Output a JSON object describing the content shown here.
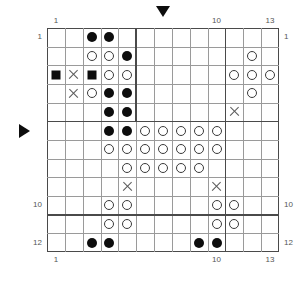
{
  "puzzle": {
    "title": "Grid Puzzle",
    "columns": 13,
    "rows": 12,
    "colors": {
      "filled": "#0d0d0d",
      "open_stroke": "#3a3a3a",
      "x_mark": "#5a5a5a",
      "grid_line": "#9a9a9a",
      "grid_line_thick": "#4a4a4a",
      "label": "#555555",
      "background": "#ffffff"
    },
    "axis_labels": {
      "top": [
        {
          "col": 1,
          "text": "1"
        },
        {
          "col": 10,
          "text": "10"
        },
        {
          "col": 13,
          "text": "13"
        }
      ],
      "bottom": [
        {
          "col": 1,
          "text": "1"
        },
        {
          "col": 10,
          "text": "10"
        },
        {
          "col": 13,
          "text": "13"
        }
      ],
      "left": [
        {
          "row": 1,
          "text": "1"
        },
        {
          "row": 10,
          "text": "10"
        },
        {
          "row": 12,
          "text": "12"
        }
      ],
      "right": [
        {
          "row": 1,
          "text": "1"
        },
        {
          "row": 10,
          "text": "10"
        },
        {
          "row": 12,
          "text": "12"
        }
      ]
    },
    "markers": [
      {
        "name": "column-marker-down",
        "glyph": "triangle-down",
        "col": 7
      },
      {
        "name": "row-marker-right",
        "glyph": "triangle-right",
        "row": 6
      }
    ],
    "thick_lines": {
      "vertical": [
        {
          "after_col": 5,
          "from_row": 1,
          "to_row": 5
        },
        {
          "after_col": 10,
          "from_row": 1,
          "to_row": 12
        }
      ],
      "horizontal": [
        {
          "after_row": 5,
          "from_col": 1,
          "to_col": 13
        },
        {
          "after_row": 10,
          "from_col": 1,
          "to_col": 13
        }
      ]
    },
    "cells": [
      {
        "row": 1,
        "col": 3,
        "mark": "filled"
      },
      {
        "row": 1,
        "col": 4,
        "mark": "filled"
      },
      {
        "row": 2,
        "col": 3,
        "mark": "open"
      },
      {
        "row": 2,
        "col": 4,
        "mark": "open"
      },
      {
        "row": 2,
        "col": 5,
        "mark": "filled"
      },
      {
        "row": 2,
        "col": 12,
        "mark": "open"
      },
      {
        "row": 3,
        "col": 1,
        "mark": "square"
      },
      {
        "row": 3,
        "col": 2,
        "mark": "x"
      },
      {
        "row": 3,
        "col": 3,
        "mark": "square"
      },
      {
        "row": 3,
        "col": 4,
        "mark": "open"
      },
      {
        "row": 3,
        "col": 5,
        "mark": "open"
      },
      {
        "row": 3,
        "col": 11,
        "mark": "open"
      },
      {
        "row": 3,
        "col": 12,
        "mark": "open"
      },
      {
        "row": 3,
        "col": 13,
        "mark": "open"
      },
      {
        "row": 4,
        "col": 2,
        "mark": "x"
      },
      {
        "row": 4,
        "col": 3,
        "mark": "open"
      },
      {
        "row": 4,
        "col": 4,
        "mark": "filled"
      },
      {
        "row": 4,
        "col": 5,
        "mark": "filled"
      },
      {
        "row": 4,
        "col": 12,
        "mark": "open"
      },
      {
        "row": 5,
        "col": 4,
        "mark": "filled"
      },
      {
        "row": 5,
        "col": 5,
        "mark": "filled"
      },
      {
        "row": 5,
        "col": 11,
        "mark": "x"
      },
      {
        "row": 6,
        "col": 4,
        "mark": "filled"
      },
      {
        "row": 6,
        "col": 5,
        "mark": "filled"
      },
      {
        "row": 6,
        "col": 6,
        "mark": "open"
      },
      {
        "row": 6,
        "col": 7,
        "mark": "open"
      },
      {
        "row": 6,
        "col": 8,
        "mark": "open"
      },
      {
        "row": 6,
        "col": 9,
        "mark": "open"
      },
      {
        "row": 6,
        "col": 10,
        "mark": "open"
      },
      {
        "row": 7,
        "col": 4,
        "mark": "open"
      },
      {
        "row": 7,
        "col": 5,
        "mark": "open"
      },
      {
        "row": 7,
        "col": 6,
        "mark": "open"
      },
      {
        "row": 7,
        "col": 7,
        "mark": "open"
      },
      {
        "row": 7,
        "col": 8,
        "mark": "open"
      },
      {
        "row": 7,
        "col": 9,
        "mark": "open"
      },
      {
        "row": 7,
        "col": 10,
        "mark": "open"
      },
      {
        "row": 8,
        "col": 5,
        "mark": "open"
      },
      {
        "row": 8,
        "col": 6,
        "mark": "open"
      },
      {
        "row": 8,
        "col": 7,
        "mark": "open"
      },
      {
        "row": 8,
        "col": 8,
        "mark": "open"
      },
      {
        "row": 8,
        "col": 9,
        "mark": "open"
      },
      {
        "row": 9,
        "col": 5,
        "mark": "x"
      },
      {
        "row": 9,
        "col": 10,
        "mark": "x"
      },
      {
        "row": 10,
        "col": 4,
        "mark": "open"
      },
      {
        "row": 10,
        "col": 5,
        "mark": "open"
      },
      {
        "row": 10,
        "col": 10,
        "mark": "open"
      },
      {
        "row": 10,
        "col": 11,
        "mark": "open"
      },
      {
        "row": 11,
        "col": 4,
        "mark": "open"
      },
      {
        "row": 11,
        "col": 5,
        "mark": "open"
      },
      {
        "row": 11,
        "col": 10,
        "mark": "open"
      },
      {
        "row": 11,
        "col": 11,
        "mark": "open"
      },
      {
        "row": 12,
        "col": 3,
        "mark": "filled"
      },
      {
        "row": 12,
        "col": 4,
        "mark": "filled"
      },
      {
        "row": 12,
        "col": 9,
        "mark": "filled"
      },
      {
        "row": 12,
        "col": 10,
        "mark": "filled"
      }
    ]
  }
}
